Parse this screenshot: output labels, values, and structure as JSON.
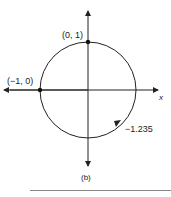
{
  "diagram": {
    "type": "unit-circle",
    "subfigure_label": "(b)",
    "axes": {
      "x_label": "x"
    },
    "points": [
      {
        "name": "top",
        "label": "(0, 1)"
      },
      {
        "name": "left",
        "label": "(−1, 0)"
      }
    ],
    "arc_marker": {
      "label": "−1.235"
    },
    "colors": {
      "stroke": "#222222",
      "background": "#ffffff"
    }
  }
}
